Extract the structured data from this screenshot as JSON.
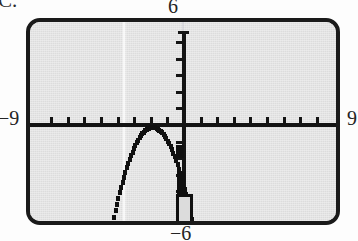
{
  "figure": {
    "problem_label": "C.",
    "type": "graphing-calculator-screen"
  },
  "window": {
    "top_label": "6",
    "left_label": "−9",
    "right_label": "9",
    "bottom_label": "−6",
    "xmin": -9,
    "xmax": 9,
    "ymin": -6,
    "ymax": 6,
    "xscl": 1,
    "yscl": 1
  },
  "chart_data": {
    "type": "line",
    "title": "",
    "xlabel": "",
    "ylabel": "",
    "xlim": [
      -9,
      9
    ],
    "ylim": [
      -6,
      6
    ],
    "grid": false,
    "legend": "none",
    "axis_ticks": {
      "x": [
        -8,
        -7,
        -6,
        -5,
        -4,
        -3,
        -2,
        -1,
        1,
        2,
        3,
        4,
        5,
        6,
        7,
        8
      ],
      "y": [
        -5,
        -4,
        -3,
        -2,
        -1,
        1,
        2,
        3,
        4,
        5
      ]
    },
    "annotations": [
      "downward-opening parabola",
      "vertex on the x-axis",
      "both branches exit bottom of window"
    ],
    "series": [
      {
        "name": "y = -(x + 2)^2",
        "vertex": [
          -2,
          0
        ],
        "opens": "down",
        "x": [
          -4.4,
          -4.2,
          -4.0,
          -3.8,
          -3.6,
          -3.4,
          -3.2,
          -3.0,
          -2.8,
          -2.6,
          -2.4,
          -2.2,
          -2.0,
          -1.8,
          -1.6,
          -1.4,
          -1.2,
          -1.0,
          -0.8,
          -0.6,
          -0.4,
          -0.2,
          0.0,
          0.2,
          0.4
        ],
        "values": [
          -5.76,
          -4.84,
          -4.0,
          -3.24,
          -2.56,
          -1.96,
          -1.44,
          -1.0,
          -0.64,
          -0.36,
          -0.16,
          -0.04,
          0.0,
          -0.04,
          -0.16,
          -0.36,
          -0.64,
          -1.0,
          -1.44,
          -1.96,
          -2.56,
          -3.24,
          -4.0,
          -4.84,
          -5.76
        ]
      }
    ]
  },
  "colors": {
    "screen_fill": "#dcdcdc",
    "bezel": "#1a1a1a",
    "ink": "#101010",
    "paper": "#fdfdfd"
  }
}
